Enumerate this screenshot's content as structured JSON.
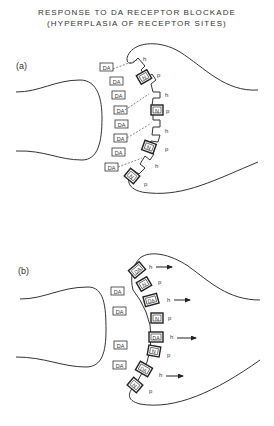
{
  "title": {
    "line1": "RESPONSE TO DA RECEPTOR BLOCKADE",
    "line2": "(HYPERPLASIA OF RECEPTOR SITES)"
  },
  "panels": [
    {
      "label": "(a)",
      "free_molecules": [
        "DA",
        "DA",
        "DA",
        "DA",
        "DA",
        "DA",
        "DA",
        "DA"
      ],
      "receptor_sites": [
        {
          "type": "h",
          "occupant": "",
          "blocked_attempt": true
        },
        {
          "type": "p",
          "occupant": "N"
        },
        {
          "type": "h",
          "occupant": "",
          "blocked_attempt": true
        },
        {
          "type": "p",
          "occupant": "N"
        },
        {
          "type": "h",
          "occupant": "",
          "blocked_attempt": true
        },
        {
          "type": "p",
          "occupant": "N"
        },
        {
          "type": "h",
          "occupant": "",
          "blocked_attempt": true
        },
        {
          "type": "p",
          "occupant": "N"
        }
      ],
      "site_labels": {
        "high": "h",
        "presynaptic": "p"
      }
    },
    {
      "label": "(b)",
      "free_molecules": [
        "DA",
        "DA",
        "DA",
        "DA"
      ],
      "receptor_sites": [
        {
          "type": "h",
          "occupant": "DA",
          "response_arrow": true
        },
        {
          "type": "p",
          "occupant": "N"
        },
        {
          "type": "h",
          "occupant": "DA",
          "response_arrow": true
        },
        {
          "type": "p",
          "occupant": "N"
        },
        {
          "type": "h",
          "occupant": "DA",
          "response_arrow": true
        },
        {
          "type": "p",
          "occupant": "N"
        },
        {
          "type": "h",
          "occupant": "DA",
          "response_arrow": true
        },
        {
          "type": "p",
          "occupant": "N"
        }
      ],
      "site_labels": {
        "high": "h",
        "presynaptic": "p"
      }
    }
  ],
  "glyphs": {
    "da": "DA",
    "n": "N",
    "h": "h",
    "p": "p"
  }
}
